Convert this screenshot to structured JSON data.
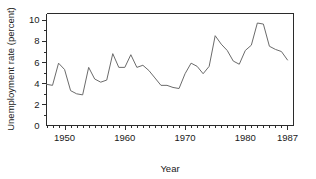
{
  "chart_data": {
    "type": "line",
    "title": "",
    "xlabel": "Year",
    "ylabel": "Unemployment rate (percent)",
    "xlim": [
      1947,
      1988
    ],
    "ylim": [
      0,
      10.6
    ],
    "grid": false,
    "legend": null,
    "line_color": "#6b6b6b",
    "axis_color": "#2b2b2b",
    "x_tick_labels": [
      "1950",
      "1960",
      "1970",
      "1980",
      "1987"
    ],
    "x_tick_values": [
      1950,
      1960,
      1970,
      1980,
      1987
    ],
    "x_minor_tick_step": 1,
    "y_tick_labels": [
      "0",
      "2",
      "4",
      "6",
      "8",
      "10"
    ],
    "y_tick_values": [
      0,
      2,
      4,
      6,
      8,
      10
    ],
    "y_minor_tick_step": 1,
    "x": [
      1947,
      1948,
      1949,
      1950,
      1951,
      1952,
      1953,
      1954,
      1955,
      1956,
      1957,
      1958,
      1959,
      1960,
      1961,
      1962,
      1963,
      1964,
      1965,
      1966,
      1967,
      1968,
      1969,
      1970,
      1971,
      1972,
      1973,
      1974,
      1975,
      1976,
      1977,
      1978,
      1979,
      1980,
      1981,
      1982,
      1983,
      1984,
      1985,
      1986,
      1987
    ],
    "values": [
      3.9,
      3.8,
      5.9,
      5.3,
      3.3,
      3.0,
      2.9,
      5.5,
      4.4,
      4.1,
      4.3,
      6.8,
      5.5,
      5.5,
      6.7,
      5.5,
      5.7,
      5.2,
      4.5,
      3.8,
      3.8,
      3.6,
      3.5,
      4.9,
      5.9,
      5.6,
      4.9,
      5.6,
      8.5,
      7.7,
      7.1,
      6.1,
      5.8,
      7.1,
      7.6,
      9.7,
      9.6,
      7.5,
      7.2,
      7.0,
      6.2
    ],
    "series_name": "Unemployment rate"
  },
  "axes": {
    "x_title": "Year",
    "y_title": "Unemployment rate (percent)"
  }
}
